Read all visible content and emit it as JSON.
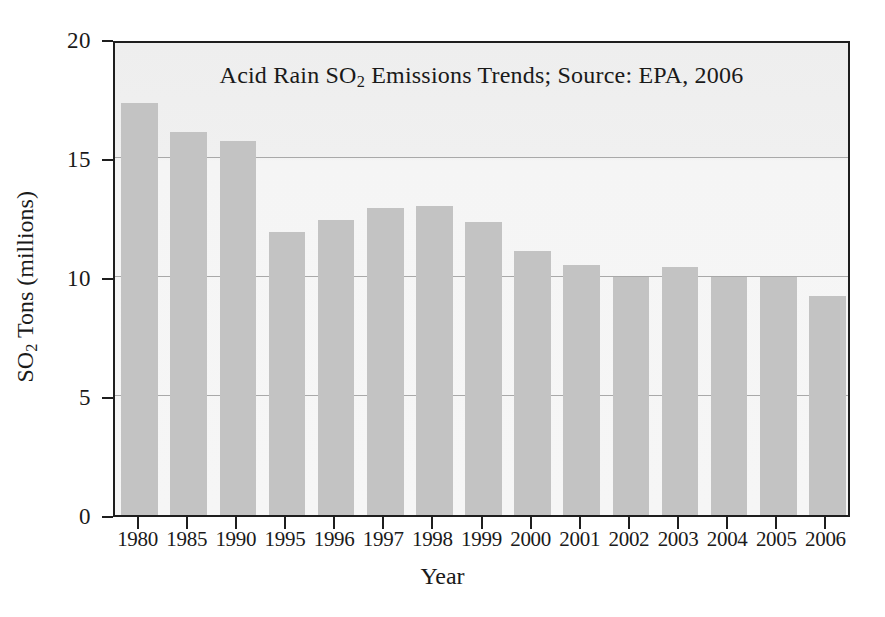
{
  "chart_data": {
    "type": "bar",
    "title": "Acid Rain SO2 Emissions Trends; Source: EPA, 2006",
    "title_parts": {
      "before": "Acid Rain SO",
      "sub": "2",
      "after": " Emissions Trends; Source: EPA, 2006"
    },
    "xlabel": "Year",
    "ylabel": "SO2 Tons (millions)",
    "ylabel_parts": {
      "before": "SO",
      "sub": "2",
      "after": " Tons (millions)"
    },
    "categories": [
      "1980",
      "1985",
      "1990",
      "1995",
      "1996",
      "1997",
      "1998",
      "1999",
      "2000",
      "2001",
      "2002",
      "2003",
      "2004",
      "2005",
      "2006"
    ],
    "values": [
      17.3,
      16.1,
      15.7,
      11.9,
      12.4,
      12.9,
      13.0,
      12.3,
      11.1,
      10.5,
      10.0,
      10.4,
      10.0,
      10.0,
      9.2
    ],
    "ylim": [
      0,
      20
    ],
    "yticks": [
      0,
      5,
      10,
      15,
      20
    ],
    "ytick_labels": [
      "0",
      "5",
      "10",
      "15",
      "20"
    ],
    "gridlines": [
      5,
      10,
      15
    ],
    "grid": true,
    "legend": null,
    "colors": {
      "bar": "#c3c3c3",
      "plot_background": "#f2f2f2",
      "axis": "#1e1e1e",
      "gridline": "#a9a9a9",
      "text": "#1a1a1a"
    }
  }
}
